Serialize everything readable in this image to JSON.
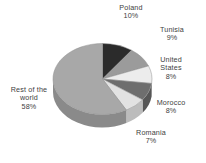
{
  "chart_data": {
    "type": "pie",
    "title": "",
    "subtitle": "",
    "xlabel": "",
    "ylabel": "",
    "grid": false,
    "legend_position": "none",
    "label_format": "name + percent",
    "style": "3d-pie",
    "background": "#ffffff",
    "text_color": "#3e3e3e",
    "categories": [
      "Poland",
      "Tunisia",
      "United States",
      "Morocco",
      "Romania",
      "Rest of the world"
    ],
    "values": [
      10,
      9,
      8,
      8,
      7,
      58
    ],
    "units": "%",
    "total": 100,
    "slices": [
      {
        "label": "Poland",
        "value": 10,
        "percent_text": "10%",
        "color": "#2b2b2b",
        "side_color": "#1c1c1c"
      },
      {
        "label": "Tunisia",
        "value": 9,
        "percent_text": "9%",
        "color": "#9b9b9b",
        "side_color": "#7b7b7b"
      },
      {
        "label": "United States",
        "value": 8,
        "percent_text": "8%",
        "color": "#ececec",
        "side_color": "#c4c4c4"
      },
      {
        "label": "Morocco",
        "value": 8,
        "percent_text": "8%",
        "color": "#6e6e6e",
        "side_color": "#565656"
      },
      {
        "label": "Romania",
        "value": 7,
        "percent_text": "7%",
        "color": "#e2e2e2",
        "side_color": "#bcbcbc"
      },
      {
        "label": "Rest of the world",
        "value": 58,
        "percent_text": "58%",
        "color": "#a8a8a8",
        "side_color": "#8a8a8a"
      }
    ]
  },
  "labels": {
    "poland": {
      "name": "Poland",
      "percent": "10%"
    },
    "tunisia": {
      "name": "Tunisia",
      "percent": "9%"
    },
    "united_states": {
      "name_line1": "United",
      "name_line2": "States",
      "percent": "8%"
    },
    "morocco": {
      "name": "Morocco",
      "percent": "8%"
    },
    "romania": {
      "name": "Romania",
      "percent": "7%"
    },
    "rest": {
      "name_line1": "Rest of the",
      "name_line2": "world",
      "percent": "58%"
    }
  }
}
